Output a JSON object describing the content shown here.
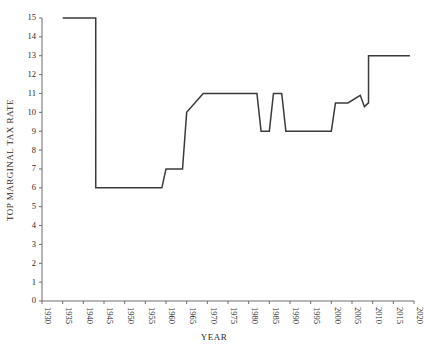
{
  "chart_data": {
    "type": "line",
    "title": "",
    "xlabel": "YEAR",
    "ylabel": "TOP MARGINAL TAX RATE",
    "xlim": [
      1930,
      2020
    ],
    "ylim": [
      0,
      15
    ],
    "xticks": [
      1930,
      1935,
      1940,
      1945,
      1950,
      1955,
      1960,
      1965,
      1970,
      1975,
      1980,
      1985,
      1990,
      1995,
      2000,
      2005,
      2010,
      2015,
      2020
    ],
    "yticks": [
      0,
      1,
      2,
      3,
      4,
      5,
      6,
      7,
      8,
      9,
      10,
      11,
      12,
      13,
      14,
      15
    ],
    "grid": false,
    "legend": false,
    "series": [
      {
        "name": "Top marginal tax rate",
        "style": "step",
        "x": [
          1935,
          1943,
          1943,
          1959,
          1959,
          1960,
          1964,
          1965,
          1969,
          1982,
          1983,
          1985,
          1986,
          1988,
          1989,
          2000,
          2001,
          2004,
          2007,
          2008,
          2009,
          2009,
          2019
        ],
        "y": [
          15,
          15,
          6,
          6,
          6,
          7,
          7,
          10,
          11,
          11,
          9,
          9,
          11,
          11,
          9,
          9,
          10.5,
          10.5,
          10.9,
          10.3,
          10.5,
          13,
          13
        ]
      }
    ],
    "segments": [
      {
        "from_year": 1935,
        "to_year": 1943,
        "value": 15
      },
      {
        "from_year": 1943,
        "to_year": 1959,
        "value": 6
      },
      {
        "from_year": 1960,
        "to_year": 1964,
        "value": 7
      },
      {
        "from_year": 1965,
        "to_year": 1969,
        "value": 10
      },
      {
        "from_year": 1969,
        "to_year": 1982,
        "value": 11
      },
      {
        "from_year": 1983,
        "to_year": 1985,
        "value": 9
      },
      {
        "from_year": 1986,
        "to_year": 1988,
        "value": 11
      },
      {
        "from_year": 1989,
        "to_year": 2000,
        "value": 9
      },
      {
        "from_year": 2001,
        "to_year": 2007,
        "value": 10.5
      },
      {
        "from_year": 2009,
        "to_year": 2019,
        "value": 13
      }
    ],
    "colors": {
      "line": "#3a3a3a",
      "axis": "#6d6d6d",
      "text": "#2b2b2b",
      "background": "#ffffff"
    }
  }
}
